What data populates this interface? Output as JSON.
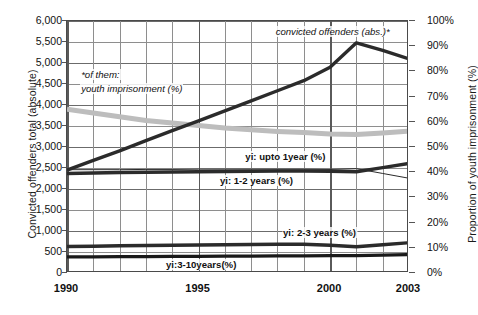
{
  "chart_data": {
    "type": "line",
    "title": "",
    "xlabel": "",
    "ylabel": "Convicted offenders total (absolute)",
    "y2label": "Proportion of youth imprisonment (%)",
    "x": [
      1990,
      1991,
      1992,
      1993,
      1994,
      1995,
      1996,
      1997,
      1998,
      1999,
      2000,
      2001,
      2002,
      2003
    ],
    "xlim": [
      1990,
      2003
    ],
    "ylim": [
      0,
      6000
    ],
    "y2lim": [
      0,
      100
    ],
    "x_tick_labels": [
      "1990",
      "1995",
      "2000",
      "2003"
    ],
    "x_tick_values": [
      1990,
      1995,
      2000,
      2003
    ],
    "y_tick_labels": [
      "0",
      "500",
      "1,000",
      "1,500",
      "2,000",
      "2,500",
      "3,000",
      "3,500",
      "4,000",
      "4,500",
      "5,000",
      "5,500",
      "6,000"
    ],
    "y_tick_values": [
      0,
      500,
      1000,
      1500,
      2000,
      2500,
      3000,
      3500,
      4000,
      4500,
      5000,
      5500,
      6000
    ],
    "y2_tick_labels": [
      "0%",
      "10%",
      "20%",
      "30%",
      "40%",
      "50%",
      "60%",
      "70%",
      "80%",
      "90%",
      "100%"
    ],
    "y2_tick_values": [
      0,
      10,
      20,
      30,
      40,
      50,
      60,
      70,
      80,
      90,
      100
    ],
    "grid": true,
    "legend": "in-plot annotations",
    "series": [
      {
        "name": "convicted offenders (abs.)*",
        "axis": "left",
        "style": "thick-dark",
        "color": "#2b2b2b",
        "values": [
          2450,
          2680,
          2910,
          3150,
          3390,
          3620,
          3860,
          4100,
          4340,
          4580,
          4900,
          5480,
          5300,
          5100
        ]
      },
      {
        "name": "*of them: youth imprisonment (%)",
        "axis": "right",
        "style": "thick-grey",
        "color": "#bdbdbd",
        "values": [
          65,
          63.5,
          62,
          60.5,
          59.5,
          58.5,
          57.5,
          56.8,
          56.2,
          55.8,
          55.2,
          55.0,
          55.6,
          56.3
        ]
      },
      {
        "name": "yi: upto 1year (%)",
        "axis": "right",
        "style": "thick-dark",
        "color": "#2b2b2b",
        "values": [
          39.5,
          39.7,
          39.9,
          40.0,
          40.1,
          40.2,
          40.3,
          40.4,
          40.5,
          40.5,
          40.4,
          40.2,
          41.8,
          43.5
        ]
      },
      {
        "name": "yi: 1-2 years (%)",
        "axis": "right",
        "style": "thin-dark",
        "color": "#2b2b2b",
        "values": [
          41.0,
          41.0,
          41.0,
          41.1,
          41.1,
          41.2,
          41.2,
          41.2,
          41.2,
          41.2,
          41.1,
          41.4,
          39.5,
          37.6
        ]
      },
      {
        "name": "yi: 2-3 years (%)",
        "axis": "right",
        "style": "thick-dark",
        "color": "#2b2b2b",
        "values": [
          10.5,
          10.6,
          10.8,
          10.9,
          11.0,
          11.1,
          11.2,
          11.3,
          11.4,
          11.4,
          11.0,
          10.4,
          11.2,
          12.0
        ]
      },
      {
        "name": "yi:3-10years(%)",
        "axis": "right",
        "style": "thick-dark",
        "color": "#1a1a1a",
        "values": [
          6.4,
          6.4,
          6.5,
          6.5,
          6.6,
          6.6,
          6.7,
          6.7,
          6.8,
          6.8,
          6.9,
          6.9,
          7.1,
          7.3
        ]
      }
    ],
    "annotations": [
      {
        "text": "convicted offenders (abs.)*",
        "x": 2000.1,
        "y2": 95.5,
        "style": "italic",
        "align": "center"
      },
      {
        "text": "*of them:",
        "x": 1990.5,
        "y2": 78.5,
        "style": "italic",
        "align": "left"
      },
      {
        "text": "youth imprisonment (%)",
        "x": 1990.5,
        "y2": 73.0,
        "style": "italic",
        "align": "left"
      },
      {
        "text": "yi: upto 1year (%)",
        "x": 1998.3,
        "y2": 46.0,
        "style": "bold",
        "align": "center"
      },
      {
        "text": "yi: 1-2 years (%)",
        "x": 1997.2,
        "y2": 36.5,
        "style": "bold",
        "align": "center"
      },
      {
        "text": "yi: 2-3 years (%)",
        "x": 1999.6,
        "y2": 16.0,
        "style": "bold",
        "align": "center"
      },
      {
        "text": "yi:3-10years(%)",
        "x": 1995.1,
        "y2": 3.2,
        "style": "bold",
        "align": "center"
      }
    ]
  },
  "colors": {
    "dark_series": "#2b2b2b",
    "grey_series": "#bdbdbd",
    "grid": "#8e8e8e",
    "frame": "#4a4a4a",
    "text": "#111111",
    "background": "#ffffff"
  }
}
